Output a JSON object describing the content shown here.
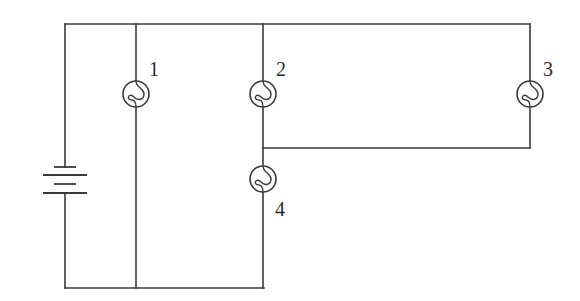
{
  "diagram": {
    "type": "circuit",
    "colors": {
      "line": "#3a3a3a",
      "text": "#2a2a2a",
      "background": "#ffffff"
    },
    "battery": {
      "label": "battery",
      "cells": 2
    },
    "bulbs": [
      {
        "id": "bulb-1",
        "label": "1"
      },
      {
        "id": "bulb-2",
        "label": "2"
      },
      {
        "id": "bulb-3",
        "label": "3"
      },
      {
        "id": "bulb-4",
        "label": "4"
      }
    ],
    "topology": {
      "bulb_1": "parallel branch directly across battery",
      "bulb_2": "in series with bulb 4 from top rail to bottom rail",
      "bulb_3": "connected between top rail and junction between bulbs 2 and 4 (parallel with bulb 2)",
      "bulb_4": "between junction and bottom rail"
    }
  }
}
